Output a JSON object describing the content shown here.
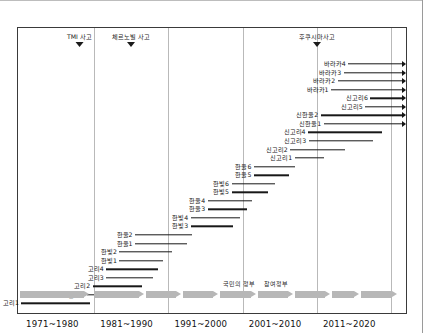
{
  "chart_data": {
    "type": "bar",
    "title": "",
    "xlabel": "",
    "ylabel": "",
    "orientation": "horizontal-timeline",
    "grid": true,
    "legend_position": "none",
    "xlim": [
      1971,
      2023
    ],
    "x_tick_labels": [
      "1971~1980",
      "1981~1990",
      "1991~2000",
      "2001~2010",
      "2011~2020"
    ],
    "x_tick_years": [
      1975.5,
      1985.5,
      1995.5,
      2005.5,
      2015.5
    ],
    "gridline_years": [
      1981,
      1991,
      2001,
      2011,
      2021
    ],
    "annotations": [
      {
        "label": "TMI 사고",
        "year": 1979
      },
      {
        "label": "체르노빌 사고",
        "year": 1986
      },
      {
        "label": "후쿠시마사고",
        "year": 2011
      }
    ],
    "government_terms": [
      {
        "label": "",
        "start": 1971,
        "end": 1980.5
      },
      {
        "label": "",
        "start": 1981,
        "end": 1988
      },
      {
        "label": "",
        "start": 1988,
        "end": 1993
      },
      {
        "label": "",
        "start": 1993,
        "end": 1998
      },
      {
        "label": "국민의 정부",
        "start": 1998,
        "end": 2003
      },
      {
        "label": "참여정부",
        "start": 2003,
        "end": 2008
      },
      {
        "label": "",
        "start": 2008,
        "end": 2013
      },
      {
        "label": "",
        "start": 2013,
        "end": 2017
      },
      {
        "label": "",
        "start": 2017,
        "end": 2022
      }
    ],
    "series_name": "원전 건설 기간",
    "bars": [
      {
        "name": "바라카4",
        "start": 2015.2,
        "end": 2023.0,
        "ongoing": true
      },
      {
        "name": "바라카3",
        "start": 2014.6,
        "end": 2023.0,
        "ongoing": true
      },
      {
        "name": "바라카2",
        "start": 2013.8,
        "end": 2023.0,
        "ongoing": true
      },
      {
        "name": "바라카1",
        "start": 2012.9,
        "end": 2023.0,
        "ongoing": true
      },
      {
        "name": "신고리6",
        "start": 2018.2,
        "end": 2023.0,
        "ongoing": true
      },
      {
        "name": "신고리5",
        "start": 2017.5,
        "end": 2023.0,
        "ongoing": true
      },
      {
        "name": "신한울2",
        "start": 2011.5,
        "end": 2023.0,
        "ongoing": true
      },
      {
        "name": "신한울1",
        "start": 2011.9,
        "end": 2023.0,
        "ongoing": true
      },
      {
        "name": "신고리4",
        "start": 2009.8,
        "end": 2019.7,
        "ongoing": false
      },
      {
        "name": "신고리3",
        "start": 2009.9,
        "end": 2018.6,
        "ongoing": false
      },
      {
        "name": "신고리2",
        "start": 2007.4,
        "end": 2014.8,
        "ongoing": false
      },
      {
        "name": "신고리1",
        "start": 2008.0,
        "end": 2012.0,
        "ongoing": false
      },
      {
        "name": "한울6",
        "start": 2002.5,
        "end": 2008.0,
        "ongoing": false
      },
      {
        "name": "한울5",
        "start": 2002.5,
        "end": 2007.3,
        "ongoing": false
      },
      {
        "name": "한빛6",
        "start": 1999.5,
        "end": 2005.4,
        "ongoing": false
      },
      {
        "name": "한빛5",
        "start": 1999.5,
        "end": 2004.4,
        "ongoing": false
      },
      {
        "name": "한울4",
        "start": 1996.3,
        "end": 2002.2,
        "ongoing": false
      },
      {
        "name": "한울3",
        "start": 1996.3,
        "end": 2001.6,
        "ongoing": false
      },
      {
        "name": "한빛4",
        "start": 1994.0,
        "end": 2000.6,
        "ongoing": false
      },
      {
        "name": "한빛3",
        "start": 1994.0,
        "end": 1999.7,
        "ongoing": false
      },
      {
        "name": "한울2",
        "start": 1986.5,
        "end": 1994.2,
        "ongoing": false
      },
      {
        "name": "한울1",
        "start": 1986.5,
        "end": 1993.5,
        "ongoing": false
      },
      {
        "name": "한빛2",
        "start": 1984.4,
        "end": 1991.5,
        "ongoing": false
      },
      {
        "name": "한빛1",
        "start": 1984.4,
        "end": 1990.3,
        "ongoing": false
      },
      {
        "name": "고리4",
        "start": 1982.6,
        "end": 1989.6,
        "ongoing": false
      },
      {
        "name": "고리3",
        "start": 1982.6,
        "end": 1988.9,
        "ongoing": false
      },
      {
        "name": "고리2",
        "start": 1980.8,
        "end": 1987.5,
        "ongoing": false
      },
      {
        "name": "월성1",
        "start": 1980.0,
        "end": 1986.6,
        "ongoing": false
      },
      {
        "name": "고리1",
        "start": 1971.2,
        "end": 1980.4,
        "ongoing": false
      }
    ]
  }
}
